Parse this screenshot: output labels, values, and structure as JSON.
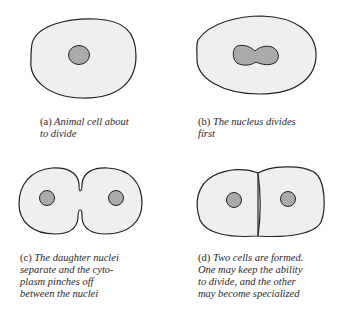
{
  "colors": {
    "cytoplasm": "#efefef",
    "outline": "#222222",
    "nucleus": "#a9a9a9",
    "caption_text": "#2a2a2a"
  },
  "panels": [
    {
      "id": "a",
      "label": "(a)",
      "lines": [
        "Animal cell about",
        "to divide"
      ],
      "stage": "cell before division"
    },
    {
      "id": "b",
      "label": "(b)",
      "lines": [
        "The nucleus divides",
        "first"
      ],
      "stage": "nuclear division"
    },
    {
      "id": "c",
      "label": "(c)",
      "lines": [
        "The daughter nuclei",
        "separate and the cyto-",
        "plasm pinches off",
        "between the nuclei"
      ],
      "stage": "cytoplasm pinching"
    },
    {
      "id": "d",
      "label": "(d)",
      "lines": [
        "Two cells are formed.",
        "One may keep the ability",
        "to divide, and the other",
        "may become specialized"
      ],
      "stage": "two daughter cells"
    }
  ]
}
